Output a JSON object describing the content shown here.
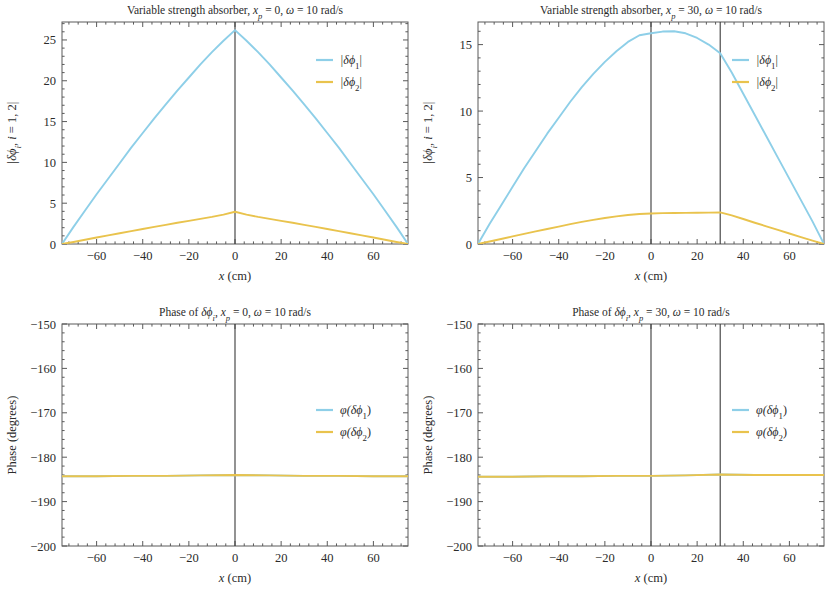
{
  "figure": {
    "width": 831,
    "height": 603,
    "background": "#ffffff",
    "colors": {
      "series1": "#8ecfe8",
      "series2": "#e9c34d",
      "axis": "#5a5a5a",
      "vline": "#3a3a3a",
      "text": "#2b2b2b"
    }
  },
  "panels": [
    {
      "id": "top-left",
      "title_parts": [
        "Variable strength absorber, ",
        "x",
        "p",
        " = 0, ",
        "ω",
        " = 10 rad/s"
      ],
      "title": "Variable strength absorber, x_p = 0, ω = 10 rad/s",
      "xlabel": "x (cm)",
      "ylabel": "|δϕi, i = 1, 2|",
      "ylabel_parts": [
        "|δϕ",
        "i",
        ", ",
        "i",
        " = 1, 2|"
      ],
      "xticks": [
        -60,
        -40,
        -20,
        0,
        20,
        40,
        60
      ],
      "xticklabels": [
        "-60",
        "-40",
        "-20",
        "0",
        "20",
        "40",
        "60"
      ],
      "yticks": [
        0,
        5,
        10,
        15,
        20,
        25
      ],
      "yticklabels": [
        "0",
        "5",
        "10",
        "15",
        "20",
        "25"
      ],
      "xlim": [
        -75,
        75
      ],
      "ylim": [
        0,
        27.2
      ],
      "vlines": [
        0
      ],
      "legend": [
        {
          "label": "|δϕ₁|",
          "base": "|δϕ",
          "sub": "1",
          "tail": "|",
          "color": "#8ecfe8"
        },
        {
          "label": "|δϕ₂|",
          "base": "|δϕ",
          "sub": "2",
          "tail": "|",
          "color": "#e9c34d"
        }
      ]
    },
    {
      "id": "top-right",
      "title_parts": [
        "Variable strength absorber, ",
        "x",
        "p",
        " = 30, ",
        "ω",
        " = 10 rad/s"
      ],
      "title": "Variable strength absorber, x_p = 30, ω = 10 rad/s",
      "xlabel": "x (cm)",
      "ylabel": "|δϕi, i = 1, 2|",
      "ylabel_parts": [
        "|δϕ",
        "i",
        ", ",
        "i",
        " = 1, 2|"
      ],
      "xticks": [
        -60,
        -40,
        -20,
        0,
        20,
        40,
        60
      ],
      "xticklabels": [
        "-60",
        "-40",
        "-20",
        "0",
        "20",
        "40",
        "60"
      ],
      "yticks": [
        0,
        5,
        10,
        15
      ],
      "yticklabels": [
        "0",
        "5",
        "10",
        "15"
      ],
      "xlim": [
        -75,
        75
      ],
      "ylim": [
        0,
        16.7
      ],
      "vlines": [
        0,
        30
      ],
      "legend": [
        {
          "label": "|δϕ₁|",
          "base": "|δϕ",
          "sub": "1",
          "tail": "|",
          "color": "#8ecfe8"
        },
        {
          "label": "|δϕ₂|",
          "base": "|δϕ",
          "sub": "2",
          "tail": "|",
          "color": "#e9c34d"
        }
      ]
    },
    {
      "id": "bottom-left",
      "title_parts": [
        "Phase of ",
        "δϕ",
        "i",
        ", ",
        "x",
        "p",
        " = 0, ",
        "ω",
        " = 10 rad/s"
      ],
      "title": "Phase of δϕi, x_p = 0, ω = 10 rad/s",
      "xlabel": "x (cm)",
      "ylabel": "Phase (degrees)",
      "xticks": [
        -60,
        -40,
        -20,
        0,
        20,
        40,
        60
      ],
      "xticklabels": [
        "-60",
        "-40",
        "-20",
        "0",
        "20",
        "40",
        "60"
      ],
      "yticks": [
        -200,
        -190,
        -180,
        -170,
        -160,
        -150
      ],
      "yticklabels": [
        "-200",
        "-190",
        "-180",
        "-170",
        "-160",
        "-150"
      ],
      "xlim": [
        -75,
        75
      ],
      "ylim": [
        -200,
        -150
      ],
      "vlines": [
        0
      ],
      "legend": [
        {
          "label": "φ(δϕ₁)",
          "base": "φ(δϕ",
          "sub": "1",
          "tail": ")",
          "color": "#8ecfe8"
        },
        {
          "label": "φ(δϕ₂)",
          "base": "φ(δϕ",
          "sub": "2",
          "tail": ")",
          "color": "#e9c34d"
        }
      ]
    },
    {
      "id": "bottom-right",
      "title_parts": [
        "Phase of ",
        "δϕ",
        "i",
        ", ",
        "x",
        "p",
        " = 30, ",
        "ω",
        " = 10 rad/s"
      ],
      "title": "Phase of δϕi, x_p = 30, ω = 10 rad/s",
      "xlabel": "x (cm)",
      "ylabel": "Phase (degrees)",
      "xticks": [
        -60,
        -40,
        -20,
        0,
        20,
        40,
        60
      ],
      "xticklabels": [
        "-60",
        "-40",
        "-20",
        "0",
        "20",
        "40",
        "60"
      ],
      "yticks": [
        -200,
        -190,
        -180,
        -170,
        -160,
        -150
      ],
      "yticklabels": [
        "-200",
        "-190",
        "-180",
        "-170",
        "-160",
        "-150"
      ],
      "xlim": [
        -75,
        75
      ],
      "ylim": [
        -200,
        -150
      ],
      "vlines": [
        0,
        30
      ],
      "legend": [
        {
          "label": "φ(δϕ₁)",
          "base": "φ(δϕ",
          "sub": "1",
          "tail": ")",
          "color": "#8ecfe8"
        },
        {
          "label": "φ(δϕ₂)",
          "base": "φ(δϕ",
          "sub": "2",
          "tail": ")",
          "color": "#e9c34d"
        }
      ]
    }
  ],
  "chart_data": [
    {
      "type": "line",
      "panel": "top-left",
      "title": "Variable strength absorber, x_p = 0, ω = 10 rad/s",
      "xlabel": "x (cm)",
      "ylabel": "|δϕi, i = 1, 2|",
      "xlim": [
        -75,
        75
      ],
      "ylim": [
        0,
        27.2
      ],
      "grid": false,
      "legend_position": "upper-right",
      "annotations": [
        {
          "type": "vline",
          "x": 0
        }
      ],
      "x": [
        -75,
        -70,
        -65,
        -60,
        -55,
        -50,
        -45,
        -40,
        -35,
        -30,
        -25,
        -20,
        -15,
        -10,
        -5,
        0,
        5,
        10,
        15,
        20,
        25,
        30,
        35,
        40,
        45,
        50,
        55,
        60,
        65,
        70,
        75
      ],
      "series": [
        {
          "name": "|δϕ₁|",
          "color": "#8ecfe8",
          "values": [
            0.0,
            2.1,
            4.1,
            6.1,
            8.0,
            9.9,
            11.8,
            13.6,
            15.4,
            17.1,
            18.8,
            20.4,
            22.0,
            23.5,
            24.9,
            26.2,
            24.9,
            23.5,
            22.0,
            20.4,
            18.8,
            17.1,
            15.4,
            13.6,
            11.8,
            9.9,
            8.0,
            6.1,
            4.1,
            2.1,
            0.0
          ]
        },
        {
          "name": "|δϕ₂|",
          "color": "#e9c34d",
          "values": [
            0.0,
            0.25,
            0.52,
            0.79,
            1.05,
            1.32,
            1.58,
            1.84,
            2.1,
            2.35,
            2.6,
            2.84,
            3.08,
            3.32,
            3.6,
            3.95,
            3.6,
            3.32,
            3.08,
            2.84,
            2.6,
            2.35,
            2.1,
            1.84,
            1.58,
            1.32,
            1.05,
            0.79,
            0.52,
            0.25,
            0.0
          ]
        }
      ]
    },
    {
      "type": "line",
      "panel": "top-right",
      "title": "Variable strength absorber, x_p = 30, ω = 10 rad/s",
      "xlabel": "x (cm)",
      "ylabel": "|δϕi, i = 1, 2|",
      "xlim": [
        -75,
        75
      ],
      "ylim": [
        0,
        16.7
      ],
      "grid": false,
      "legend_position": "upper-right",
      "annotations": [
        {
          "type": "vline",
          "x": 0
        },
        {
          "type": "vline",
          "x": 30
        }
      ],
      "x": [
        -75,
        -70,
        -65,
        -60,
        -55,
        -50,
        -45,
        -40,
        -35,
        -30,
        -25,
        -20,
        -15,
        -10,
        -5,
        0,
        5,
        10,
        15,
        20,
        25,
        30,
        35,
        40,
        45,
        50,
        55,
        60,
        65,
        70,
        75
      ],
      "series": [
        {
          "name": "|δϕ₁|",
          "color": "#8ecfe8",
          "values": [
            0.0,
            1.5,
            2.9,
            4.3,
            5.7,
            7.0,
            8.3,
            9.5,
            10.7,
            11.8,
            12.8,
            13.7,
            14.5,
            15.2,
            15.7,
            15.85,
            15.98,
            16.0,
            15.85,
            15.5,
            15.0,
            14.35,
            12.9,
            11.3,
            9.7,
            8.1,
            6.5,
            4.9,
            3.3,
            1.7,
            0.0
          ]
        },
        {
          "name": "|δϕ₂|",
          "color": "#e9c34d",
          "values": [
            0.0,
            0.19,
            0.38,
            0.57,
            0.76,
            0.95,
            1.13,
            1.31,
            1.49,
            1.66,
            1.82,
            1.96,
            2.08,
            2.18,
            2.26,
            2.3,
            2.32,
            2.33,
            2.34,
            2.35,
            2.36,
            2.38,
            2.15,
            1.88,
            1.6,
            1.33,
            1.06,
            0.79,
            0.52,
            0.26,
            0.0
          ]
        }
      ]
    },
    {
      "type": "line",
      "panel": "bottom-left",
      "title": "Phase of δϕi, x_p = 0, ω = 10 rad/s",
      "xlabel": "x (cm)",
      "ylabel": "Phase (degrees)",
      "xlim": [
        -75,
        75
      ],
      "ylim": [
        -200,
        -150
      ],
      "grid": false,
      "legend_position": "upper-right",
      "annotations": [
        {
          "type": "vline",
          "x": 0
        }
      ],
      "x": [
        -75,
        -60,
        -45,
        -30,
        -15,
        0,
        15,
        30,
        45,
        60,
        75
      ],
      "series": [
        {
          "name": "φ(δϕ₁)",
          "color": "#8ecfe8",
          "values": [
            -184.3,
            -184.3,
            -184.2,
            -184.2,
            -184.1,
            -184.0,
            -184.1,
            -184.2,
            -184.2,
            -184.3,
            -184.3
          ]
        },
        {
          "name": "φ(δϕ₂)",
          "color": "#e9c34d",
          "values": [
            -184.3,
            -184.3,
            -184.2,
            -184.2,
            -184.1,
            -184.0,
            -184.1,
            -184.2,
            -184.2,
            -184.3,
            -184.3
          ]
        }
      ]
    },
    {
      "type": "line",
      "panel": "bottom-right",
      "title": "Phase of δϕi, x_p = 30, ω = 10 rad/s",
      "xlabel": "x (cm)",
      "ylabel": "Phase (degrees)",
      "xlim": [
        -75,
        75
      ],
      "ylim": [
        -200,
        -150
      ],
      "grid": false,
      "legend_position": "upper-right",
      "annotations": [
        {
          "type": "vline",
          "x": 0
        },
        {
          "type": "vline",
          "x": 30
        }
      ],
      "x": [
        -75,
        -60,
        -45,
        -30,
        -15,
        0,
        15,
        30,
        45,
        60,
        75
      ],
      "series": [
        {
          "name": "φ(δϕ₁)",
          "color": "#8ecfe8",
          "values": [
            -184.4,
            -184.4,
            -184.3,
            -184.3,
            -184.2,
            -184.2,
            -184.1,
            -183.9,
            -184.0,
            -184.0,
            -184.0
          ]
        },
        {
          "name": "φ(δϕ₂)",
          "color": "#e9c34d",
          "values": [
            -184.4,
            -184.4,
            -184.3,
            -184.3,
            -184.2,
            -184.2,
            -184.1,
            -183.9,
            -184.0,
            -184.0,
            -184.0
          ]
        }
      ]
    }
  ]
}
